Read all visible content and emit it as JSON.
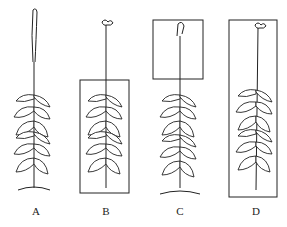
{
  "figure": {
    "type": "plant-phototropism-diagram",
    "panels": [
      {
        "label": "A",
        "cover": "none",
        "tip": "plain"
      },
      {
        "label": "B",
        "cover": "lower-stem-and-leaves",
        "tip": "flowered"
      },
      {
        "label": "C",
        "cover": "top-tip",
        "tip": "plain"
      },
      {
        "label": "D",
        "cover": "whole-plant",
        "tip": "flowered"
      }
    ]
  },
  "colors": {
    "line": "#222222",
    "background": "#ffffff"
  }
}
